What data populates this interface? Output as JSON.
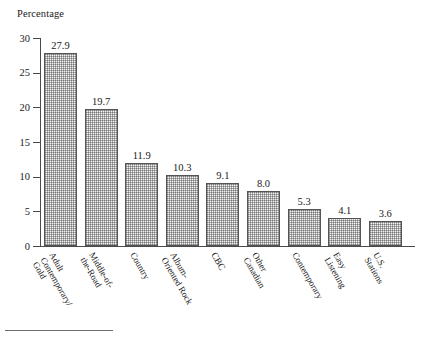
{
  "chart_data": {
    "type": "bar",
    "title": "Percentage",
    "xlabel": "",
    "ylabel": "Percentage",
    "ylim": [
      0,
      30
    ],
    "yticks": [
      0,
      5,
      10,
      15,
      20,
      25,
      30
    ],
    "grid": false,
    "legend": null,
    "orientation": "vertical",
    "value_labels": true,
    "categories": [
      "Adult Contemporary/ Gold",
      "Middle-of-the-Road",
      "Country",
      "Album-Oriented Rock",
      "CBC",
      "Other Canadian",
      "Contemporary",
      "Easy Listening",
      "U.S. Stations"
    ],
    "values": [
      27.9,
      19.7,
      11.9,
      10.3,
      9.1,
      8.0,
      5.3,
      4.1,
      3.6
    ],
    "bars": [
      {
        "value": 27.9,
        "value_label": "27.9",
        "label_lines": [
          "Adult",
          "Contemporary/",
          "Gold"
        ]
      },
      {
        "value": 19.7,
        "value_label": "19.7",
        "label_lines": [
          "Middle-of-",
          "the-Road"
        ]
      },
      {
        "value": 11.9,
        "value_label": "11.9",
        "label_lines": [
          "Country"
        ]
      },
      {
        "value": 10.3,
        "value_label": "10.3",
        "label_lines": [
          "Album-",
          "Oriented Rock"
        ]
      },
      {
        "value": 9.1,
        "value_label": "9.1",
        "label_lines": [
          "CBC"
        ]
      },
      {
        "value": 8.0,
        "value_label": "8.0",
        "label_lines": [
          "Other",
          "Canadian"
        ]
      },
      {
        "value": 5.3,
        "value_label": "5.3",
        "label_lines": [
          "Contemporary"
        ]
      },
      {
        "value": 4.1,
        "value_label": "4.1",
        "label_lines": [
          "Easy",
          "Listening"
        ]
      },
      {
        "value": 3.6,
        "value_label": "3.6",
        "label_lines": [
          "U.S.",
          "Stations"
        ]
      }
    ],
    "ytick_labels": [
      "0",
      "5",
      "10",
      "15",
      "20",
      "25",
      "30"
    ],
    "colors": {
      "bar_fill": "#f2f2f2",
      "bar_pattern": "#787878",
      "bar_border": "#555555",
      "axis": "#4a4a4a",
      "text": "#1a1a1a",
      "background": "#ffffff",
      "footer_rule": "#6b6b6b"
    }
  }
}
